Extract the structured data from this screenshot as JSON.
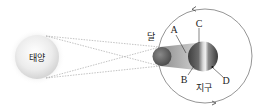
{
  "diagram": {
    "title": "",
    "bodies": {
      "sun": {
        "label": "태양"
      },
      "moon": {
        "label": "달"
      },
      "earth": {
        "label": "지구"
      }
    },
    "points": {
      "A": "A",
      "B": "B",
      "C": "C",
      "D": "D"
    },
    "colors": {
      "sun_fill": "#e6e6e6",
      "sun_glow": "#f2f2f2",
      "moon_fill": "#6a6a6a",
      "shadow_cone": "#9a9a9a",
      "earth_dark": "#4a4a4a",
      "earth_light": "#e8e8e8",
      "orbit_line": "#777777",
      "ray_line": "#9a9a9a"
    }
  }
}
